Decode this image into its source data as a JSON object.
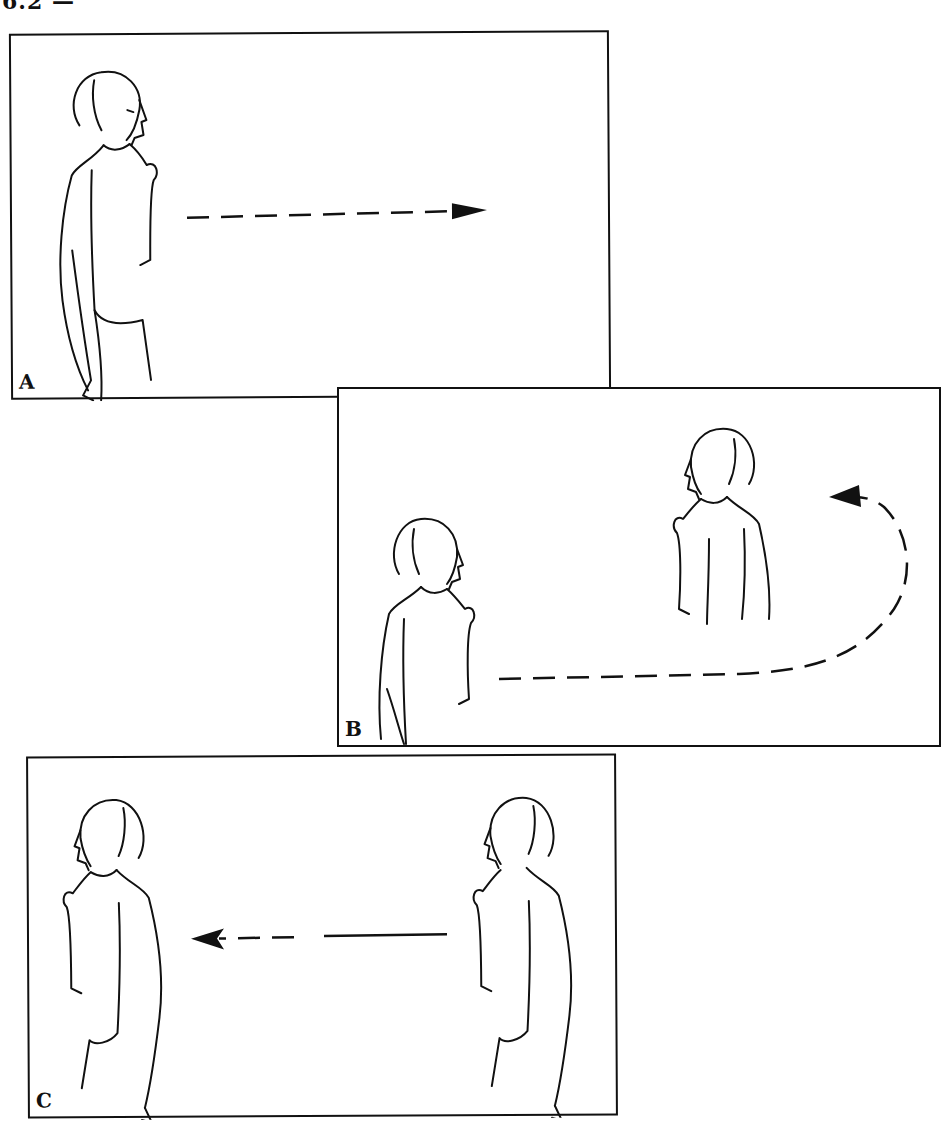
{
  "header": {
    "fragment": "6.2 —"
  },
  "panels": [
    {
      "label": "A",
      "description": "Woman facing right, dashed arrow pointing right",
      "arrow_direction": "right"
    },
    {
      "label": "B",
      "description": "Woman turns and walks around; dashed path curving back to the left",
      "arrow_direction": "curved-back-left"
    },
    {
      "label": "C",
      "description": "Two figures facing left; arrow pointing left, partially dashed",
      "arrow_direction": "left"
    }
  ],
  "colors": {
    "ink": "#111111",
    "paper": "#ffffff"
  }
}
